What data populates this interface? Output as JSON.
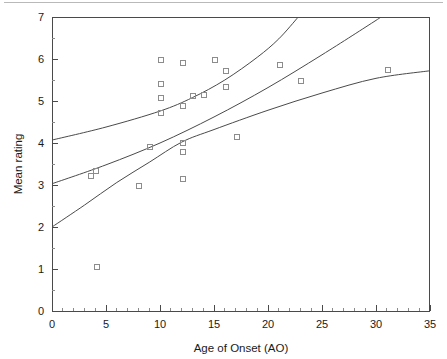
{
  "figure": {
    "top_rule_visible": true,
    "background_color": "#ffffff",
    "marker_color": "#8c8c8c",
    "curve_color": "#4a4a4a",
    "axis_color": "#4a4a4a"
  },
  "chart_data": {
    "type": "scatter",
    "title": "",
    "xlabel": "Age of Onset (AO)",
    "ylabel": "Mean rating",
    "xlim": [
      0,
      35
    ],
    "ylim": [
      0,
      7
    ],
    "xticks": [
      0,
      5,
      10,
      15,
      20,
      25,
      30,
      35
    ],
    "yticks": [
      0,
      1,
      2,
      3,
      4,
      5,
      6,
      7
    ],
    "xtick_labels": [
      "0",
      "5",
      "10",
      "15",
      "20",
      "25",
      "30",
      "35"
    ],
    "ytick_labels": [
      "0",
      "1",
      "2",
      "3",
      "4",
      "5",
      "6",
      "7"
    ],
    "x_minor_tick_step": 1,
    "y_minor_tick_step": 0.5,
    "grid": false,
    "legend": null,
    "marker_style": "open-square",
    "points": [
      {
        "x": 3.5,
        "y": 3.25
      },
      {
        "x": 4.0,
        "y": 3.35
      },
      {
        "x": 4.1,
        "y": 1.08
      },
      {
        "x": 8.0,
        "y": 3.01
      },
      {
        "x": 9.0,
        "y": 3.93
      },
      {
        "x": 10.0,
        "y": 6.0
      },
      {
        "x": 10.0,
        "y": 5.42
      },
      {
        "x": 10.0,
        "y": 5.1
      },
      {
        "x": 10.0,
        "y": 4.75
      },
      {
        "x": 12.0,
        "y": 5.92
      },
      {
        "x": 12.0,
        "y": 4.9
      },
      {
        "x": 12.0,
        "y": 4.02
      },
      {
        "x": 12.0,
        "y": 3.81
      },
      {
        "x": 12.0,
        "y": 3.17
      },
      {
        "x": 13.0,
        "y": 5.15
      },
      {
        "x": 14.0,
        "y": 5.17
      },
      {
        "x": 15.0,
        "y": 6.0
      },
      {
        "x": 16.0,
        "y": 5.74
      },
      {
        "x": 16.0,
        "y": 5.35
      },
      {
        "x": 17.0,
        "y": 4.17
      },
      {
        "x": 21.0,
        "y": 5.89
      },
      {
        "x": 23.0,
        "y": 5.49
      },
      {
        "x": 31.0,
        "y": 5.77
      }
    ],
    "series": [
      {
        "name": "regression-line",
        "kind": "line",
        "points": [
          {
            "x": 0,
            "y": 3.03
          },
          {
            "x": 5,
            "y": 3.48
          },
          {
            "x": 10,
            "y": 4.0
          },
          {
            "x": 15,
            "y": 4.62
          },
          {
            "x": 20,
            "y": 5.32
          },
          {
            "x": 25,
            "y": 6.1
          },
          {
            "x": 30,
            "y": 6.92
          },
          {
            "x": 30.4,
            "y": 7.0
          }
        ]
      },
      {
        "name": "upper-confidence-band",
        "kind": "line",
        "points": [
          {
            "x": 0,
            "y": 4.07
          },
          {
            "x": 5,
            "y": 4.38
          },
          {
            "x": 10,
            "y": 4.76
          },
          {
            "x": 13,
            "y": 5.08
          },
          {
            "x": 16,
            "y": 5.5
          },
          {
            "x": 19,
            "y": 6.04
          },
          {
            "x": 21,
            "y": 6.48
          },
          {
            "x": 22.8,
            "y": 7.0
          }
        ]
      },
      {
        "name": "lower-confidence-band",
        "kind": "line",
        "points": [
          {
            "x": 0,
            "y": 2.0
          },
          {
            "x": 3,
            "y": 2.52
          },
          {
            "x": 6,
            "y": 3.06
          },
          {
            "x": 9,
            "y": 3.54
          },
          {
            "x": 12,
            "y": 4.02
          },
          {
            "x": 15,
            "y": 4.32
          },
          {
            "x": 20,
            "y": 4.78
          },
          {
            "x": 25,
            "y": 5.19
          },
          {
            "x": 30,
            "y": 5.54
          },
          {
            "x": 35,
            "y": 5.72
          }
        ]
      }
    ]
  }
}
